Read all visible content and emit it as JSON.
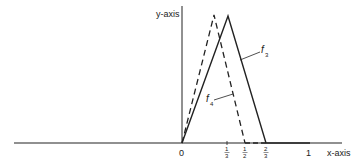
{
  "diagram": {
    "axes": {
      "x_label": "x-axis",
      "y_label": "y-axis"
    },
    "ticks": [
      {
        "id": "t0",
        "label": "0",
        "value": 0,
        "type": "int"
      },
      {
        "id": "t13",
        "num": "1",
        "den": "3",
        "value": 0.3333
      },
      {
        "id": "t12",
        "num": "1",
        "den": "2",
        "value": 0.5
      },
      {
        "id": "t23",
        "num": "2",
        "den": "3",
        "value": 0.6667
      },
      {
        "id": "t1",
        "label": "1",
        "value": 1,
        "type": "int"
      }
    ],
    "functions": [
      {
        "name": "f",
        "subscript": "3",
        "style": "solid",
        "description": "triangle from 0 peaking near 1/3, returning to 0 at 2/3"
      },
      {
        "name": "f",
        "subscript": "4",
        "style": "dashed",
        "description": "triangle from 0 peaking near 1/4, returning to 0 at 1/2"
      }
    ],
    "colors": {
      "line": "#222222",
      "background": "#ffffff"
    }
  }
}
